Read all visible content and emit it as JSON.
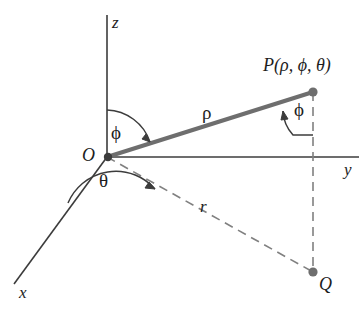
{
  "figure": {
    "background_color": "#ffffff",
    "axis_color": "#3c3c3c",
    "ray_color": "#6e6e6e",
    "dash_color": "#808080",
    "point_color": "#6e6e6e",
    "text_color": "#1d1d1d",
    "width": 361,
    "height": 316
  },
  "labels": {
    "z_axis": "z",
    "y_axis": "y",
    "x_axis": "x",
    "origin": "O",
    "point_p": "P(ρ, ϕ, θ)",
    "point_q": "Q",
    "rho": "ρ",
    "r": "r",
    "phi_origin": "ϕ",
    "phi_point": "ϕ",
    "theta": "θ"
  },
  "geometry": {
    "origin": {
      "x": 107,
      "y": 157
    },
    "point_p": {
      "x": 313,
      "y": 92
    },
    "point_q": {
      "x": 313,
      "y": 272
    },
    "z_axis_top": {
      "x": 107,
      "y": 15
    },
    "y_axis_end": {
      "x": 359,
      "y": 157
    },
    "x_axis_end": {
      "x": 14,
      "y": 284
    }
  }
}
